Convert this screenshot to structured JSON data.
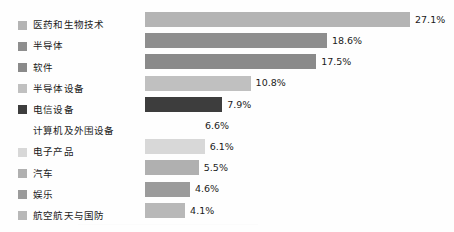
{
  "chart_data": {
    "type": "bar",
    "orientation": "horizontal",
    "title": "",
    "subtitle": "",
    "xlabel": "",
    "ylabel": "",
    "grid": false,
    "legend_position": "left",
    "value_suffix": "%",
    "xlim": [
      0,
      27.1
    ],
    "categories": [
      "医药和生物技术",
      "半导体",
      "软件",
      "半导体设备",
      "电信设备",
      "计算机及外围设备",
      "电子产品",
      "汽车",
      "娱乐",
      "航空航天与国防"
    ],
    "values": [
      27.1,
      18.6,
      17.5,
      10.8,
      7.9,
      6.6,
      6.1,
      5.5,
      4.6,
      4.1
    ],
    "value_labels": [
      "27.1%",
      "18.6%",
      "17.5%",
      "10.8%",
      "7.9%",
      "6.6%",
      "6.1%",
      "5.5%",
      "4.6%",
      "4.1%"
    ],
    "bar_colors": [
      "#b4b4b4",
      "#8e8e8e",
      "#8a8a8a",
      "#c0c0c0",
      "#3d3d3d",
      "none",
      "#d8d8d8",
      "#b0b0b0",
      "#9b9b9b",
      "#b8b8b8"
    ],
    "legend_swatch_colors": [
      "#b4b4b4",
      "#8e8e8e",
      "#8a8a8a",
      "#c0c0c0",
      "#3d3d3d",
      "none",
      "#d8d8d8",
      "#b0b0b0",
      "#9b9b9b",
      "#b8b8b8"
    ],
    "background_color": "#fefefe",
    "text_color": "#1b1b1b"
  }
}
